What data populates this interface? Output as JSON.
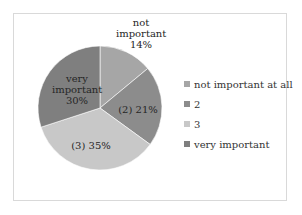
{
  "chart_data": {
    "type": "pie",
    "title": "",
    "categories": [
      "not important at all",
      "2",
      "3",
      "very important"
    ],
    "values": [
      14,
      21,
      35,
      30
    ],
    "unit": "%",
    "colors": [
      "#a6a6a6",
      "#8c8c8c",
      "#c8c8c8",
      "#7f7f7f"
    ],
    "data_labels": [
      "not important 14%",
      "(2) 21%",
      "(3) 35%",
      "very important 30%"
    ],
    "legend_position": "right",
    "start_angle_deg": 0,
    "direction": "clockwise"
  },
  "labels": {
    "slice0_line1": "not",
    "slice0_line2": "important",
    "slice0_line3": "14%",
    "slice1": "(2) 21%",
    "slice2": "(3) 35%",
    "slice3_line1": "very",
    "slice3_line2": "important",
    "slice3_line3": "30%"
  },
  "legend": {
    "items": [
      {
        "label": "not important at all",
        "color": "#a6a6a6"
      },
      {
        "label": "2",
        "color": "#8c8c8c"
      },
      {
        "label": "3",
        "color": "#c8c8c8"
      },
      {
        "label": "very important",
        "color": "#7f7f7f"
      }
    ]
  }
}
